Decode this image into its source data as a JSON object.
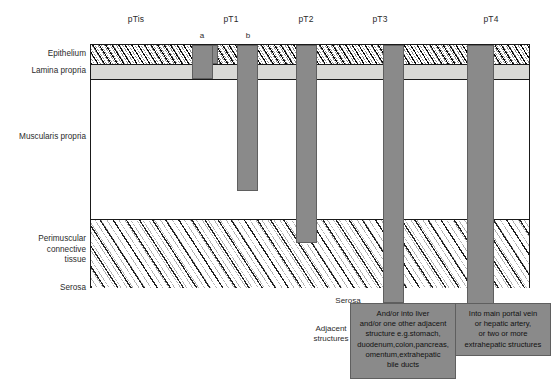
{
  "diagram": {
    "title_row": {
      "stages": [
        {
          "id": "pTis",
          "label": "pTis",
          "x": 136
        },
        {
          "id": "pT1",
          "label": "pT1",
          "x": 231
        },
        {
          "id": "pT2",
          "label": "pT2",
          "x": 306
        },
        {
          "id": "pT3",
          "label": "pT3",
          "x": 380
        },
        {
          "id": "pT4",
          "label": "pT4",
          "x": 491
        }
      ],
      "sub_labels": [
        {
          "id": "a",
          "label": "a",
          "x": 202
        },
        {
          "id": "b",
          "label": "b",
          "x": 248
        }
      ]
    },
    "tissue_layers": [
      {
        "id": "epithelium",
        "label": "Epithelium",
        "y": 54
      },
      {
        "id": "lamina-propria",
        "label": "Lamina propria",
        "y": 71
      },
      {
        "id": "muscularis-propria",
        "label": "Muscularis propria",
        "y": 137
      },
      {
        "id": "perimuscular-tissue",
        "label": "Perimuscular\nconnective\ntissue",
        "y": 250
      },
      {
        "id": "serosa",
        "label": "Serosa",
        "y": 288
      }
    ],
    "tumors": [
      {
        "id": "tumor-ptis",
        "stage": "pTis",
        "x": 192,
        "y": 45,
        "w": 26,
        "h": 19
      },
      {
        "id": "tumor-pt1a",
        "stage": "pT1a",
        "x": 192,
        "y": 45,
        "w": 21,
        "h": 34
      },
      {
        "id": "tumor-pt1b",
        "stage": "pT1b",
        "x": 237,
        "y": 45,
        "w": 21,
        "h": 146
      },
      {
        "id": "tumor-pt2",
        "stage": "pT2",
        "x": 296,
        "y": 45,
        "w": 21,
        "h": 198
      },
      {
        "id": "tumor-pt3",
        "stage": "pT3",
        "x": 383,
        "y": 45,
        "w": 21,
        "h": 258
      },
      {
        "id": "tumor-pt4",
        "stage": "pT4",
        "x": 467,
        "y": 45,
        "w": 27,
        "h": 265
      }
    ],
    "notes": {
      "serosa_tag": "Serosa",
      "adjacent_structures": "Adjacent\nstructures",
      "pt3_box": "And/or into liver\nand/or one other adjacent\nstructure e.g.stomach,\nduodenum,colon,pancreas,\nomentum,extrahepatic\nbile ducts",
      "pt4_box": "Into main portal vein\nor hepatic artery,\nor two or more\nextrahepatic structures"
    },
    "colors": {
      "tumor_fill": "#8a8a8a",
      "tumor_stroke": "#5f5f5f",
      "lamina_fill": "#d9d9d6",
      "frame_stroke": "#1a1a1a",
      "text": "#2b2b2b"
    }
  }
}
